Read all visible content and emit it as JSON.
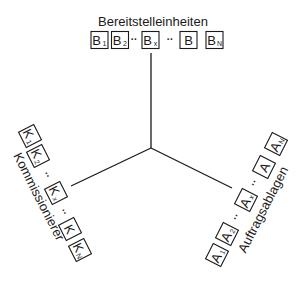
{
  "diagram": {
    "center": {
      "x": 151,
      "y": 148
    },
    "axes": [
      {
        "name": "bereitstellung",
        "x2": 151,
        "y2": 53
      },
      {
        "name": "kommissionierer",
        "x2": 71,
        "y2": 186
      },
      {
        "name": "auftragsablagen",
        "x2": 232,
        "y2": 188
      }
    ],
    "labels": {
      "top": {
        "text": "Bereitstelleinheiten",
        "x": 153,
        "y": 23,
        "angle": 0
      },
      "left": {
        "text": "Kommissionierer",
        "x": 38,
        "y": 197,
        "angle": 63
      },
      "right": {
        "text": "Auftragsablagen",
        "x": 264,
        "y": 210,
        "angle": -63
      }
    },
    "groups": {
      "bereitstelleinheiten": {
        "items": [
          {
            "type": "box",
            "main": "B",
            "sub": "1",
            "x": 99.5,
            "y": 40,
            "angle": 0
          },
          {
            "type": "box",
            "main": "B",
            "sub": "2",
            "x": 120,
            "y": 40,
            "angle": 0
          },
          {
            "type": "dots",
            "text": "··",
            "x": 134,
            "y": 40,
            "angle": 0
          },
          {
            "type": "box",
            "main": "B",
            "sub": "x",
            "x": 150.5,
            "y": 40,
            "angle": 0
          },
          {
            "type": "dots",
            "text": "··",
            "x": 170,
            "y": 40,
            "angle": 0
          },
          {
            "type": "box",
            "main": "B",
            "sub": "",
            "x": 188.5,
            "y": 40,
            "angle": 0
          },
          {
            "type": "box",
            "main": "B",
            "sub": "N",
            "x": 214.5,
            "y": 40,
            "angle": 0
          }
        ]
      },
      "kommissionierer": {
        "items": [
          {
            "type": "box",
            "main": "K",
            "sub": "1",
            "x": 30,
            "y": 136,
            "angle": 63
          },
          {
            "type": "box",
            "main": "K",
            "sub": "2",
            "x": 38,
            "y": 156,
            "angle": 63
          },
          {
            "type": "dots",
            "text": "··",
            "x": 47,
            "y": 175,
            "angle": 63
          },
          {
            "type": "box",
            "main": "K",
            "sub": "x",
            "x": 56,
            "y": 193,
            "angle": 63
          },
          {
            "type": "dots",
            "text": "··",
            "x": 64,
            "y": 212,
            "angle": 63
          },
          {
            "type": "box",
            "main": "K",
            "sub": "",
            "x": 70,
            "y": 229,
            "angle": 63
          },
          {
            "type": "box",
            "main": "K",
            "sub": "N",
            "x": 80,
            "y": 250,
            "angle": 63
          }
        ]
      },
      "auftragsablagen": {
        "items": [
          {
            "type": "box",
            "main": "A",
            "sub": "1",
            "x": 217,
            "y": 255,
            "angle": -63
          },
          {
            "type": "box",
            "main": "A",
            "sub": "2",
            "x": 227,
            "y": 234,
            "angle": -63
          },
          {
            "type": "dots",
            "text": "··",
            "x": 236,
            "y": 217,
            "angle": -63
          },
          {
            "type": "box",
            "main": "A",
            "sub": "x",
            "x": 246,
            "y": 200,
            "angle": -63
          },
          {
            "type": "dots",
            "text": "··",
            "x": 254,
            "y": 183,
            "angle": -63
          },
          {
            "type": "box",
            "main": "A",
            "sub": "",
            "x": 264,
            "y": 167,
            "angle": -63
          },
          {
            "type": "box",
            "main": "A",
            "sub": "N",
            "x": 276,
            "y": 144,
            "angle": -63
          }
        ]
      }
    }
  }
}
